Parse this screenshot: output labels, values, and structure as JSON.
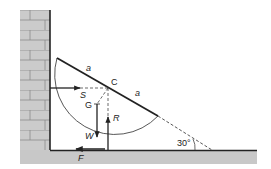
{
  "diagram": {
    "type": "statics free-body diagram",
    "labels": {
      "half_length_upper": "a",
      "half_length_lower": "a",
      "center": "C",
      "center_of_mass": "G",
      "wall_reaction": "S",
      "weight": "W",
      "floor_normal": "R",
      "friction": "F",
      "angle": "30°"
    },
    "colors": {
      "brick_fill": "#c9c9c9",
      "brick_mortar": "#8a8a8a",
      "ground_fill": "#c8c8c8",
      "line": "#222222"
    }
  }
}
